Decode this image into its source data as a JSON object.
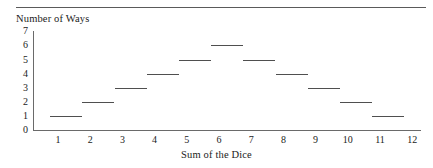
{
  "chart_data": {
    "type": "bar",
    "title": "",
    "subtitle": "",
    "xlabel": "Sum of the Dice",
    "ylabel": "Number of Ways",
    "categories": [
      2,
      3,
      4,
      5,
      6,
      7,
      8,
      9,
      10,
      11,
      12
    ],
    "values": [
      1,
      2,
      3,
      4,
      5,
      6,
      5,
      4,
      3,
      2,
      1
    ],
    "x_tick_labels": [
      "1",
      "2",
      "3",
      "4",
      "5",
      "6",
      "7",
      "8",
      "9",
      "10",
      "11",
      "12"
    ],
    "y_tick_labels": [
      "7",
      "6",
      "5",
      "4",
      "3",
      "2",
      "1",
      "0"
    ],
    "xlim": [
      0.5,
      12.5
    ],
    "ylim": [
      0,
      7
    ],
    "grid": false,
    "legend": null,
    "annotations": [],
    "series": [
      {
        "name": "Number of Ways",
        "values": [
          1,
          2,
          3,
          4,
          5,
          6,
          5,
          4,
          3,
          2,
          1
        ]
      }
    ],
    "colors": {
      "line": "#4f4f4f",
      "axis": "#6a6a6a",
      "text": "#1b1b1b",
      "rule": "#5a5a5a",
      "background": "#ffffff"
    }
  },
  "page": {
    "top_rule": "horizontal-rule"
  }
}
